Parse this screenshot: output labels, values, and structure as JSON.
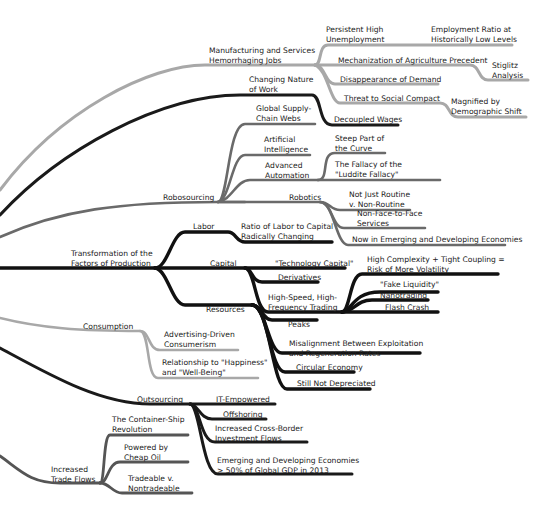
{
  "colors": {
    "light": "#a8a8a8",
    "dark": "#1a1a1a",
    "mid": "#6a6a6a",
    "text": "#222222"
  },
  "nodes": {
    "manufacturing": "Manufacturing and Services\nHemorrhaging Jobs",
    "persistent": "Persistent High\nUnemployment",
    "employment_ratio": "Employment Ratio at\nHistorically Low Levels",
    "mechanization": "Mechanization of Agriculture Precedent",
    "stiglitz": "Stiglitz\nAnalysis",
    "disappearance": "Disappearance of Demand",
    "threat": "Threat to Social Compact",
    "magnified": "Magnified by\nDemographic Shift",
    "changing_nature": "Changing Nature\nof Work",
    "decoupled": "Decoupled Wages",
    "global_supply": "Global Supply-\nChain Webs",
    "ai": "Artificial\nIntelligence",
    "advanced_auto": "Advanced\nAutomation",
    "steep": "Steep Part of\nthe Curve",
    "fallacy": "The Fallacy of the\n\"Luddite Fallacy\"",
    "robosourcing": "Robosourcing",
    "robotics": "Robotics",
    "not_just_routine": "Not Just Routine\nv. Non-Routine",
    "non_face": "Non-Face-to-Face\nServices",
    "now_emerging": "Now in Emerging and Developing Economies",
    "labor": "Labor",
    "ratio_labor": "Ratio of Labor to Capital\nRadically Changing",
    "transformation": "Transformation of the\nFactors of Production",
    "capital": "Capital",
    "tech_capital": "\"Technology Capital\"",
    "derivatives": "Derivatives",
    "hft": "High-Speed, High-\nFrequency Trading",
    "high_complexity": "High Complexity + Tight Coupling =\nRisk of More Volatility",
    "fake_liquidity": "\"Fake Liquidity\"",
    "nanotrading": "Nanotrading",
    "flash_crash": "Flash Crash",
    "resources": "Resources",
    "peaks": "Peaks",
    "misalignment": "Misalignment Between Exploitation\nand Regeneration Rates",
    "circular": "Circular Economy",
    "still_not": "Still Not Depreciated",
    "consumption": "Consumption",
    "advertising": "Advertising-Driven\nConsumerism",
    "relationship": "Relationship to \"Happiness\"\nand \"Well-Being\"",
    "outsourcing": "Outsourcing",
    "it_empowered": "IT-Empowered",
    "offshoring": "Offshoring",
    "cross_border": "Increased Cross-Border\nInvestment Flows",
    "emerging_gdp": "Emerging and Developing Economies\n> 50% of Global GDP in 2013",
    "trade_flows": "Increased\nTrade Flows",
    "container": "The Container-Ship\nRevolution",
    "cheap_oil": "Powered by\nCheap Oil",
    "tradeable": "Tradeable v.\nNontradeable"
  }
}
